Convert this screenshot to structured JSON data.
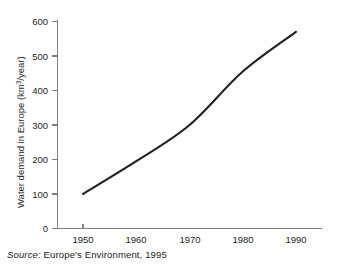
{
  "figure": {
    "caption_prefix": "Source:",
    "caption_text": "Europe's Environment, 1995"
  },
  "colors": {
    "line": "#231f20",
    "axis": "#7f7f7f",
    "text": "#231f20",
    "background": "#ffffff"
  },
  "chart_data": {
    "type": "line",
    "title": "",
    "subtitle": "",
    "xlabel": "",
    "ylabel": "Water demand in Europe (km³/year)",
    "ylabel_parts": {
      "before": "Water demand in Europe (km",
      "superscript": "3",
      "after": "/year)"
    },
    "x": [
      1950,
      1960,
      1970,
      1980,
      1990
    ],
    "xtick_labels": [
      "1950",
      "1960",
      "1970",
      "1980",
      "1990"
    ],
    "ytick_labels": [
      "0",
      "100",
      "200",
      "300",
      "400",
      "500",
      "600"
    ],
    "yticks": [
      0,
      100,
      200,
      300,
      400,
      500,
      600
    ],
    "values": [
      100,
      195,
      300,
      455,
      570
    ],
    "series": [
      {
        "name": "Water demand in Europe",
        "values": [
          100,
          195,
          300,
          455,
          570
        ]
      }
    ],
    "xlim": [
      1947,
      1993
    ],
    "ylim": [
      0,
      600
    ],
    "grid": false,
    "legend": false,
    "legend_position": "none",
    "annotations": []
  }
}
